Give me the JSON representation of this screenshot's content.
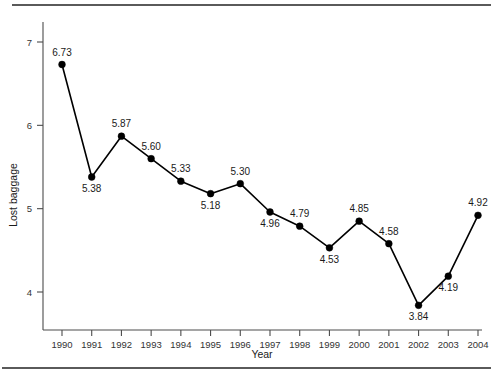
{
  "figure": {
    "has_top_rule": true,
    "has_bottom_rule": true,
    "caption_fragment": ""
  },
  "axes": {
    "x_title": "Year",
    "y_title": "Lost baggage",
    "y_ticks": [
      "4",
      "5",
      "6",
      "7"
    ],
    "x_ticks": [
      "1990",
      "1991",
      "1992",
      "1993",
      "1994",
      "1995",
      "1996",
      "1997",
      "1998",
      "1999",
      "2000",
      "2001",
      "2002",
      "2003",
      "2004"
    ]
  },
  "colors": {
    "line": "#000000",
    "marker": "#000000",
    "axis": "#4c4c4c",
    "rule": "#5a5a5a",
    "text": "#1a1a1a",
    "background": "#ffffff"
  },
  "chart_data": {
    "type": "line",
    "title": "",
    "subtitle": "",
    "xlabel": "Year",
    "ylabel": "Lost baggage",
    "categories": [
      "1990",
      "1991",
      "1992",
      "1993",
      "1994",
      "1995",
      "1996",
      "1997",
      "1998",
      "1999",
      "2000",
      "2001",
      "2002",
      "2003",
      "2004"
    ],
    "values": [
      6.73,
      5.38,
      5.87,
      5.6,
      5.33,
      5.18,
      5.3,
      4.96,
      4.79,
      4.53,
      4.85,
      4.58,
      3.84,
      4.19,
      4.92
    ],
    "data_labels": [
      "6.73",
      "5.38",
      "5.87",
      "5.60",
      "5.33",
      "5.18",
      "5.30",
      "4.96",
      "4.79",
      "4.53",
      "4.85",
      "4.58",
      "3.84",
      "4.19",
      "4.92"
    ],
    "label_positions": [
      "above",
      "below",
      "above",
      "above",
      "above",
      "below",
      "above",
      "below",
      "above",
      "below",
      "above",
      "above",
      "below",
      "below",
      "above"
    ],
    "ylim": [
      3.6,
      7.3
    ],
    "yticks": [
      4,
      5,
      6,
      7
    ],
    "grid": false,
    "legend": false,
    "markers": "filled-circle"
  }
}
